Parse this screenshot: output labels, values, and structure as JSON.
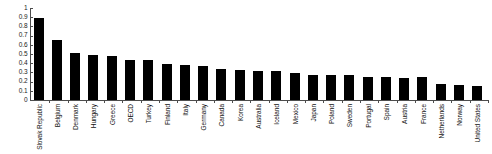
{
  "chart_data": {
    "type": "bar",
    "title": "",
    "subtitle": "",
    "xlabel": "",
    "ylabel": "",
    "ylim": [
      0,
      1
    ],
    "ytick_step": 0.1,
    "grid": false,
    "legend": null,
    "bar_color": "#000000",
    "axis_color": "#4d4d4d",
    "background": "#ffffff",
    "yticks": [
      "1",
      "0.9",
      "0.8",
      "0.7",
      "0.6",
      "0.5",
      "0.4",
      "0.3",
      "0.2",
      "0.1",
      "0"
    ],
    "ytick_values": [
      1,
      0.9,
      0.8,
      0.7,
      0.6,
      0.5,
      0.4,
      0.3,
      0.2,
      0.1,
      0
    ],
    "categories": [
      "Slovak Republic",
      "Belgium",
      "Denmark",
      "Hungary",
      "Greece",
      "OECD",
      "Turkey",
      "Finland",
      "Italy",
      "Germany",
      "Canada",
      "Korea",
      "Australia",
      "Iceland",
      "Mexico",
      "Japan",
      "Poland",
      "Sweden",
      "Portugal",
      "Spain",
      "Austria",
      "France",
      "Netherlands",
      "Norway",
      "United States"
    ],
    "values": [
      0.89,
      0.65,
      0.51,
      0.49,
      0.475,
      0.43,
      0.43,
      0.39,
      0.38,
      0.37,
      0.34,
      0.33,
      0.32,
      0.32,
      0.29,
      0.27,
      0.27,
      0.27,
      0.255,
      0.25,
      0.24,
      0.245,
      0.175,
      0.165,
      0.155
    ]
  }
}
